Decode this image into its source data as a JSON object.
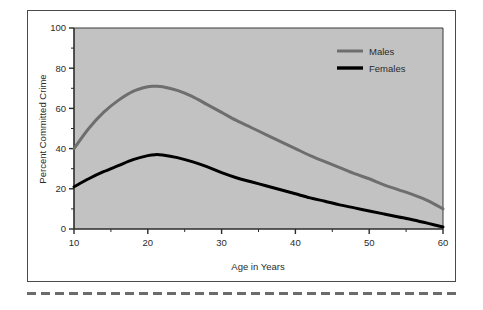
{
  "figure": {
    "background_color": "#ffffff",
    "panel_border_color": "#4a4a4a",
    "separator": {
      "name": "dashed-separator",
      "style": "dashed",
      "color": "#6b6b6b"
    }
  },
  "chart_data": {
    "type": "line",
    "title": "",
    "subtitle": "",
    "xlabel": "Age in Years",
    "ylabel": "Percent Committed Crime",
    "xlim": [
      10,
      60
    ],
    "ylim": [
      0,
      100
    ],
    "xticks": [
      "10",
      "20",
      "30",
      "40",
      "50",
      "60"
    ],
    "yticks": [
      "0",
      "20",
      "40",
      "60",
      "80",
      "100"
    ],
    "x_minor_tick_step": 5,
    "y_minor_tick_step": 10,
    "grid": false,
    "plot_background_color": "#c2c2c2",
    "legend_position": "top-right-inside",
    "x": [
      10,
      12,
      14,
      16,
      18,
      20,
      21,
      22,
      24,
      26,
      28,
      30,
      32,
      34,
      36,
      38,
      40,
      42,
      44,
      46,
      48,
      50,
      52,
      54,
      56,
      58,
      60
    ],
    "series": [
      {
        "name": "Males",
        "color": "#6e6e6e",
        "line_width": 3,
        "values": [
          40,
          50,
          58,
          64,
          68.5,
          70.8,
          71,
          70.8,
          69,
          66,
          62,
          58,
          54,
          50.5,
          47,
          43.5,
          40,
          36.5,
          33.5,
          30.5,
          27.5,
          25,
          22,
          19.5,
          17,
          14,
          10
        ]
      },
      {
        "name": "Females",
        "color": "#000000",
        "line_width": 3,
        "values": [
          21,
          25,
          28.5,
          31.5,
          34.5,
          36.5,
          37,
          36.8,
          35.5,
          33.5,
          31,
          28,
          25.5,
          23.5,
          21.5,
          19.5,
          17.5,
          15.5,
          13.8,
          12,
          10.5,
          9,
          7.5,
          6,
          4.5,
          2.8,
          1
        ]
      }
    ],
    "legend": [
      {
        "label": "Males",
        "color": "#6e6e6e"
      },
      {
        "label": "Females",
        "color": "#000000"
      }
    ]
  }
}
